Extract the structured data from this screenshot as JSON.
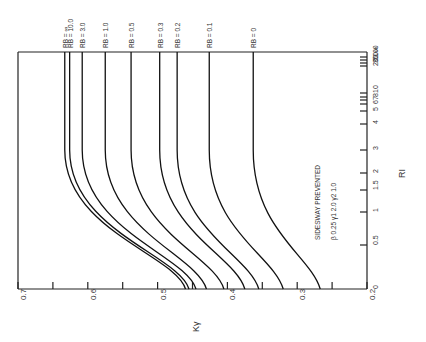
{
  "chart_data": {
    "type": "line",
    "title": "",
    "orientation": "rotated-90",
    "xlabel": "R_I",
    "ylabel": "K_γ",
    "annotation_lines": [
      "SIDESWAY PREVENTED",
      "β  0.25   γ1  2.0   γ2  1.0"
    ],
    "k_axis": {
      "label": "Kγ",
      "range": [
        0.2,
        0.7
      ],
      "tick_labels": [
        "0.7",
        "0.6",
        "0.5",
        "0.4",
        "0.3",
        "0.2"
      ],
      "minor_ticks": [
        0.65,
        0.55,
        0.45,
        0.35,
        0.25
      ]
    },
    "r_axis": {
      "label": "RI",
      "scale": "nonlinear",
      "ticks": [
        {
          "label": "0",
          "pos": 289
        },
        {
          "label": "0.5",
          "pos": 245
        },
        {
          "label": "1",
          "pos": 212
        },
        {
          "label": "1.5",
          "pos": 190
        },
        {
          "label": "2",
          "pos": 173
        },
        {
          "label": "3",
          "pos": 150
        },
        {
          "label": "4",
          "pos": 124
        },
        {
          "label": "5",
          "pos": 111
        },
        {
          "label": "6",
          "pos": 104
        },
        {
          "label": "7",
          "pos": 100
        },
        {
          "label": "8",
          "pos": 97
        },
        {
          "label": "10",
          "pos": 93
        },
        {
          "label": "20",
          "pos": 66
        },
        {
          "label": "30",
          "pos": 63
        },
        {
          "label": "50",
          "pos": 60
        },
        {
          "label": "100",
          "pos": 57
        },
        {
          "label": "∞",
          "pos": 52
        }
      ]
    },
    "series": [
      {
        "name": "RB = ∞",
        "k_at_RI_0": 0.46,
        "k_asymptote": 0.633
      },
      {
        "name": "RB = 10.0",
        "k_at_RI_0": 0.455,
        "k_asymptote": 0.626
      },
      {
        "name": "RB = 3.0",
        "k_at_RI_0": 0.445,
        "k_asymptote": 0.608
      },
      {
        "name": "RB = 1.0",
        "k_at_RI_0": 0.43,
        "k_asymptote": 0.575
      },
      {
        "name": "RB = 0.5",
        "k_at_RI_0": 0.405,
        "k_asymptote": 0.538
      },
      {
        "name": "RB = 0.3",
        "k_at_RI_0": 0.375,
        "k_asymptote": 0.497
      },
      {
        "name": "RB = 0.2",
        "k_at_RI_0": 0.355,
        "k_asymptote": 0.472
      },
      {
        "name": "RB = 0.1",
        "k_at_RI_0": 0.32,
        "k_asymptote": 0.426
      },
      {
        "name": "RB = 0",
        "k_at_RI_0": 0.267,
        "k_asymptote": 0.363
      }
    ]
  }
}
